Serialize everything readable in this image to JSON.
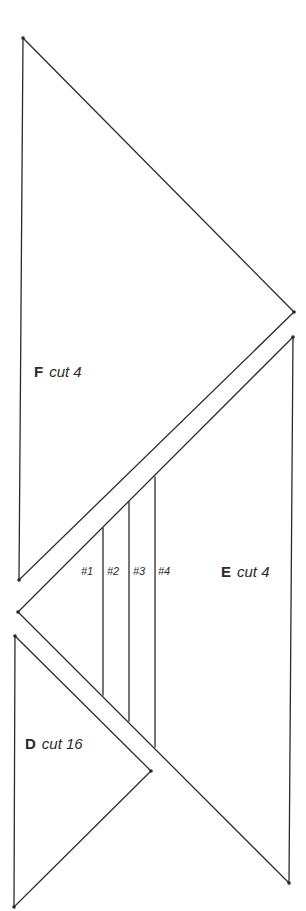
{
  "diagram": {
    "stroke_color": "#2b2b2b",
    "background": "#ffffff",
    "pieces": [
      {
        "id": "F",
        "letter": "F",
        "cut": "cut 4",
        "vertices": [
          [
            23,
            38
          ],
          [
            294,
            312
          ],
          [
            19,
            580
          ]
        ]
      },
      {
        "id": "E",
        "letter": "E",
        "cut": "cut 4",
        "vertices": [
          [
            293,
            337
          ],
          [
            18,
            612
          ],
          [
            289,
            883
          ]
        ],
        "sections": [
          "#1",
          "#2",
          "#3",
          "#4"
        ],
        "section_lines": [
          {
            "x1": 103,
            "y1": 528,
            "x2": 103,
            "y2": 695
          },
          {
            "x1": 129,
            "y1": 502,
            "x2": 129,
            "y2": 721
          },
          {
            "x1": 155,
            "y1": 477,
            "x2": 155,
            "y2": 747
          }
        ]
      },
      {
        "id": "D",
        "letter": "D",
        "cut": "cut 16",
        "vertices": [
          [
            15,
            636
          ],
          [
            151,
            771
          ],
          [
            14,
            907
          ]
        ]
      }
    ]
  }
}
